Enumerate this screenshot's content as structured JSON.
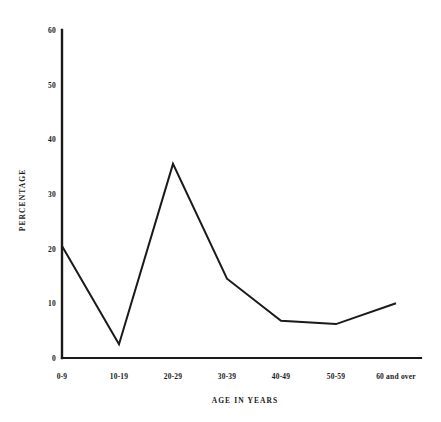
{
  "chart_data": {
    "type": "line",
    "title": "",
    "subtitle": "",
    "xlabel": "AGE IN YEARS",
    "ylabel": "PERCENTAGE",
    "categories": [
      "0-9",
      "10-19",
      "20-29",
      "30-39",
      "40-49",
      "50-59",
      "60 and over"
    ],
    "values": [
      20.5,
      2.5,
      35.5,
      14.5,
      6.8,
      6.2,
      10.0
    ],
    "series": [
      {
        "name": "Percentage",
        "values": [
          20.5,
          2.5,
          35.5,
          14.5,
          6.8,
          6.2,
          10.0
        ]
      }
    ],
    "ylim": [
      0,
      60
    ],
    "yticks": [
      0,
      10,
      20,
      30,
      40,
      50,
      60
    ],
    "ytick_labels": [
      "0",
      "10",
      "20",
      "30",
      "40",
      "50",
      "60"
    ],
    "grid": false,
    "legend": false,
    "legend_position": "none",
    "line_color": "#1a1a1a",
    "line_width": 2,
    "markers": false,
    "background_color": "#ffffff",
    "axis_color": "#1a1a1a"
  },
  "axis": {
    "y_ticks": [
      {
        "label": "60"
      },
      {
        "label": "50"
      },
      {
        "label": "40"
      },
      {
        "label": "30"
      },
      {
        "label": "20"
      },
      {
        "label": "10"
      },
      {
        "label": "0"
      }
    ],
    "x_ticks": [
      {
        "label": "0-9"
      },
      {
        "label": "10-19"
      },
      {
        "label": "20-29"
      },
      {
        "label": "30-39"
      },
      {
        "label": "40-49"
      },
      {
        "label": "50-59"
      },
      {
        "label": "60 and over"
      }
    ],
    "y_title": "PERCENTAGE",
    "x_title": "AGE IN YEARS"
  }
}
